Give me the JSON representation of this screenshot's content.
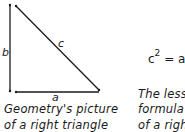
{
  "diagram": {
    "title": "Right triangle",
    "labels": {
      "b": "b",
      "c": "c",
      "a": "a"
    },
    "caption_left": [
      "Geometry's picture",
      "of a right triangle"
    ],
    "formula": {
      "base": "c",
      "exponent": "2",
      "rest": " = a"
    },
    "caption_right": [
      "The less c",
      "formula f",
      "of a right"
    ],
    "colors": {
      "line": "#1a1a1a",
      "background": "#ffffff"
    }
  }
}
